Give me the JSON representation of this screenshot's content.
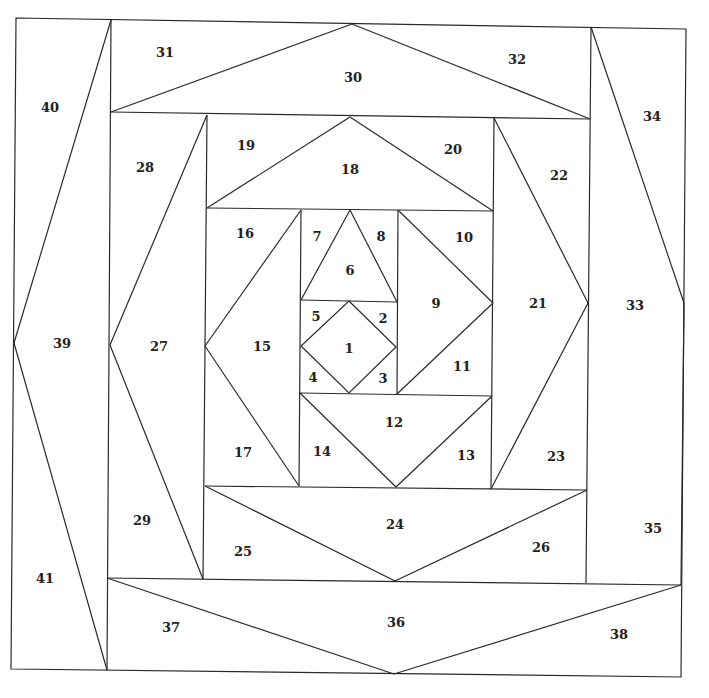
{
  "diagram": {
    "type": "paper-piecing-pattern",
    "stroke_color": "#2a2a2a",
    "label_color": "#222222",
    "background": "#ffffff",
    "pieces": [
      {
        "id": "1",
        "label": "1",
        "x": 349,
        "y": 348
      },
      {
        "id": "2",
        "label": "2",
        "x": 383,
        "y": 318
      },
      {
        "id": "3",
        "label": "3",
        "x": 383,
        "y": 378
      },
      {
        "id": "4",
        "label": "4",
        "x": 313,
        "y": 377
      },
      {
        "id": "5",
        "label": "5",
        "x": 316,
        "y": 316
      },
      {
        "id": "6",
        "label": "6",
        "x": 350,
        "y": 270
      },
      {
        "id": "7",
        "label": "7",
        "x": 317,
        "y": 236
      },
      {
        "id": "8",
        "label": "8",
        "x": 381,
        "y": 236
      },
      {
        "id": "9",
        "label": "9",
        "x": 436,
        "y": 303
      },
      {
        "id": "10",
        "label": "10",
        "x": 464,
        "y": 237
      },
      {
        "id": "11",
        "label": "11",
        "x": 462,
        "y": 366
      },
      {
        "id": "12",
        "label": "12",
        "x": 394,
        "y": 422
      },
      {
        "id": "13",
        "label": "13",
        "x": 466,
        "y": 455
      },
      {
        "id": "14",
        "label": "14",
        "x": 322,
        "y": 451
      },
      {
        "id": "15",
        "label": "15",
        "x": 262,
        "y": 346
      },
      {
        "id": "16",
        "label": "16",
        "x": 245,
        "y": 233
      },
      {
        "id": "17",
        "label": "17",
        "x": 243,
        "y": 452
      },
      {
        "id": "18",
        "label": "18",
        "x": 350,
        "y": 169
      },
      {
        "id": "19",
        "label": "19",
        "x": 246,
        "y": 145
      },
      {
        "id": "20",
        "label": "20",
        "x": 453,
        "y": 149
      },
      {
        "id": "21",
        "label": "21",
        "x": 538,
        "y": 303
      },
      {
        "id": "22",
        "label": "22",
        "x": 559,
        "y": 175
      },
      {
        "id": "23",
        "label": "23",
        "x": 556,
        "y": 456
      },
      {
        "id": "24",
        "label": "24",
        "x": 395,
        "y": 524
      },
      {
        "id": "25",
        "label": "25",
        "x": 243,
        "y": 551
      },
      {
        "id": "26",
        "label": "26",
        "x": 541,
        "y": 547
      },
      {
        "id": "27",
        "label": "27",
        "x": 159,
        "y": 346
      },
      {
        "id": "28",
        "label": "28",
        "x": 145,
        "y": 167
      },
      {
        "id": "29",
        "label": "29",
        "x": 142,
        "y": 520
      },
      {
        "id": "30",
        "label": "30",
        "x": 353,
        "y": 77
      },
      {
        "id": "31",
        "label": "31",
        "x": 165,
        "y": 52
      },
      {
        "id": "32",
        "label": "32",
        "x": 517,
        "y": 59
      },
      {
        "id": "33",
        "label": "33",
        "x": 635,
        "y": 305
      },
      {
        "id": "34",
        "label": "34",
        "x": 652,
        "y": 116
      },
      {
        "id": "35",
        "label": "35",
        "x": 653,
        "y": 528
      },
      {
        "id": "36",
        "label": "36",
        "x": 396,
        "y": 622
      },
      {
        "id": "37",
        "label": "37",
        "x": 171,
        "y": 627
      },
      {
        "id": "38",
        "label": "38",
        "x": 619,
        "y": 634
      },
      {
        "id": "39",
        "label": "39",
        "x": 62,
        "y": 343
      },
      {
        "id": "40",
        "label": "40",
        "x": 50,
        "y": 107
      },
      {
        "id": "41",
        "label": "41",
        "x": 45,
        "y": 578
      }
    ]
  }
}
